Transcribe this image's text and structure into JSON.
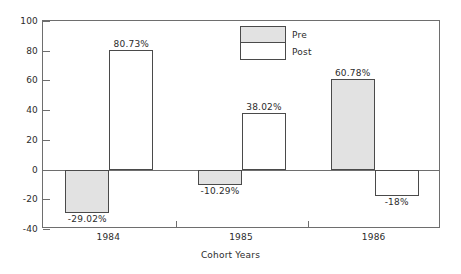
{
  "chart_data": {
    "type": "bar",
    "title": "",
    "xlabel": "Cohort Years",
    "ylabel": "",
    "categories": [
      "1984",
      "1985",
      "1986"
    ],
    "series": [
      {
        "name": "Pre",
        "color": "#e2e2e2",
        "values": [
          -29.02,
          -10.29,
          60.78
        ],
        "labels": [
          "-29.02%",
          "-10.29%",
          "60.78%"
        ]
      },
      {
        "name": "Post",
        "color": "#ffffff",
        "values": [
          80.73,
          38.02,
          -18
        ],
        "labels": [
          "80.73%",
          "38.02%",
          "-18%"
        ]
      }
    ],
    "ylim": [
      -40,
      100
    ],
    "ytick_step": 20,
    "yticks": [
      "100",
      "80",
      "60",
      "40",
      "20",
      "0",
      "-20",
      "-40"
    ],
    "grid": false,
    "legend_position": "top-center",
    "zero_line": 0
  },
  "axis": {
    "y_labels": [
      "100",
      "80",
      "60",
      "40",
      "20",
      "0",
      "-20",
      "-40"
    ],
    "x_labels": [
      "1984",
      "1985",
      "1986"
    ],
    "x_title": "Cohort Years"
  },
  "legend": {
    "entries": [
      {
        "label": "Pre"
      },
      {
        "label": "Post"
      }
    ]
  },
  "colors": {
    "pre_fill": "#e2e2e2",
    "post_fill": "#ffffff",
    "bar_outline": "#4a4a4a",
    "frame": "#6e6e6e",
    "text": "#2b2b2b"
  }
}
